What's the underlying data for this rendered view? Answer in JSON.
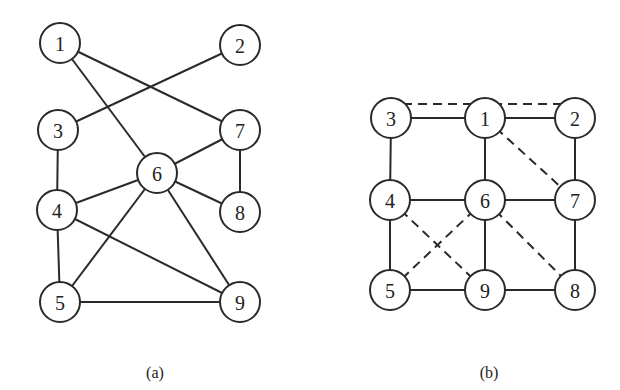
{
  "figure": {
    "panels": [
      {
        "id": "a",
        "caption": "(a)",
        "caption_pos": [
          155,
          378
        ],
        "node_radius": 20,
        "nodes": [
          {
            "label": "1",
            "x": 60,
            "y": 43
          },
          {
            "label": "2",
            "x": 240,
            "y": 45
          },
          {
            "label": "3",
            "x": 58,
            "y": 130
          },
          {
            "label": "7",
            "x": 240,
            "y": 130
          },
          {
            "label": "6",
            "x": 157,
            "y": 173
          },
          {
            "label": "4",
            "x": 57,
            "y": 210
          },
          {
            "label": "8",
            "x": 240,
            "y": 212
          },
          {
            "label": "5",
            "x": 60,
            "y": 302
          },
          {
            "label": "9",
            "x": 240,
            "y": 302
          }
        ],
        "edges": [
          {
            "from": "1",
            "to": "7",
            "style": "solid"
          },
          {
            "from": "1",
            "to": "6",
            "style": "solid"
          },
          {
            "from": "2",
            "to": "3",
            "style": "solid"
          },
          {
            "from": "3",
            "to": "4",
            "style": "solid"
          },
          {
            "from": "7",
            "to": "6",
            "style": "solid"
          },
          {
            "from": "7",
            "to": "8",
            "style": "solid"
          },
          {
            "from": "6",
            "to": "4",
            "style": "solid"
          },
          {
            "from": "6",
            "to": "8",
            "style": "solid"
          },
          {
            "from": "6",
            "to": "5",
            "style": "solid"
          },
          {
            "from": "6",
            "to": "9",
            "style": "solid"
          },
          {
            "from": "4",
            "to": "5",
            "style": "solid"
          },
          {
            "from": "4",
            "to": "9",
            "style": "solid"
          },
          {
            "from": "5",
            "to": "9",
            "style": "solid"
          }
        ]
      },
      {
        "id": "b",
        "caption": "(b)",
        "caption_pos": [
          489,
          378
        ],
        "node_radius": 20,
        "nodes": [
          {
            "label": "3",
            "x": 391,
            "y": 118
          },
          {
            "label": "1",
            "x": 485,
            "y": 118
          },
          {
            "label": "2",
            "x": 575,
            "y": 118
          },
          {
            "label": "4",
            "x": 390,
            "y": 200
          },
          {
            "label": "6",
            "x": 485,
            "y": 200
          },
          {
            "label": "7",
            "x": 575,
            "y": 200
          },
          {
            "label": "5",
            "x": 390,
            "y": 290
          },
          {
            "label": "9",
            "x": 485,
            "y": 290
          },
          {
            "label": "8",
            "x": 575,
            "y": 290
          }
        ],
        "edges": [
          {
            "from": "3",
            "to": "1",
            "style": "solid"
          },
          {
            "from": "1",
            "to": "2",
            "style": "solid"
          },
          {
            "from": "3",
            "to": "4",
            "style": "solid"
          },
          {
            "from": "1",
            "to": "6",
            "style": "solid"
          },
          {
            "from": "2",
            "to": "7",
            "style": "solid"
          },
          {
            "from": "4",
            "to": "6",
            "style": "solid"
          },
          {
            "from": "6",
            "to": "7",
            "style": "solid"
          },
          {
            "from": "4",
            "to": "5",
            "style": "solid"
          },
          {
            "from": "6",
            "to": "9",
            "style": "solid"
          },
          {
            "from": "7",
            "to": "8",
            "style": "solid"
          },
          {
            "from": "5",
            "to": "9",
            "style": "solid"
          },
          {
            "from": "9",
            "to": "8",
            "style": "solid"
          },
          {
            "from": "3",
            "to": "2",
            "style": "dashed",
            "offset_y": -14
          },
          {
            "from": "1",
            "to": "7",
            "style": "dashed"
          },
          {
            "from": "4",
            "to": "9",
            "style": "dashed"
          },
          {
            "from": "6",
            "to": "5",
            "style": "dashed"
          },
          {
            "from": "6",
            "to": "8",
            "style": "dashed"
          }
        ]
      }
    ]
  }
}
